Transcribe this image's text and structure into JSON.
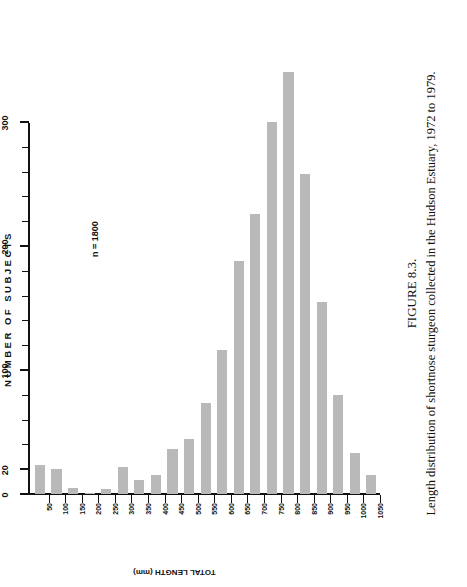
{
  "figure": {
    "number_label": "FIGURE 8.3.",
    "caption": "Length distribution of shortnose sturgeon collected in the Hudson Estuary, 1972 to 1979.",
    "annotation": "n = 1800"
  },
  "chart_data": {
    "type": "bar",
    "orientation": "horizontal",
    "title": "",
    "xlabel": "NUMBER OF SUBJECTS",
    "ylabel": "TOTAL LENGTH (mm)",
    "value_axis_label": "NUMBER OF SUBJECTS",
    "category_axis_label": "TOTAL LENGTH (mm)",
    "xlim": [
      0,
      300
    ],
    "major_ticks": [
      0,
      20,
      100,
      200,
      300
    ],
    "major_tick_labels": [
      "0",
      "20",
      "100",
      "200",
      "300"
    ],
    "minor_tick_step": 20,
    "grid": false,
    "legend": null,
    "annotations": [
      "n = 1800"
    ],
    "categories": [
      "50",
      "100",
      "150",
      "200",
      "250",
      "300",
      "350",
      "400",
      "450",
      "500",
      "550",
      "600",
      "650",
      "700",
      "750",
      "800",
      "850",
      "900",
      "950",
      "1000",
      "1050"
    ],
    "values": [
      23,
      20,
      5,
      1,
      4,
      22,
      11,
      15,
      36,
      44,
      73,
      116,
      188,
      226,
      300,
      340,
      258,
      155,
      80,
      33,
      15
    ]
  }
}
